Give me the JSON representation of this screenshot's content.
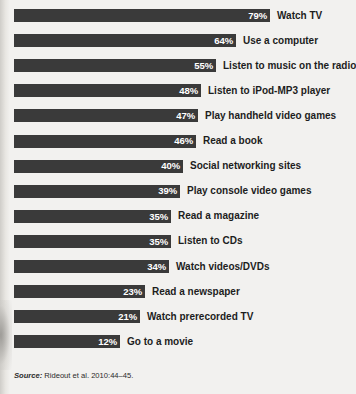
{
  "chart_data": {
    "type": "bar",
    "orientation": "horizontal",
    "title": "",
    "xlabel": "",
    "ylabel": "",
    "grid": false,
    "legend": null,
    "xlim": [
      0,
      100
    ],
    "value_suffix": "%",
    "categories": [
      "Watch TV",
      "Use a computer",
      "Listen to music on the radio",
      "Listen to iPod-MP3 player",
      "Play handheld video games",
      "Read a book",
      "Social networking sites",
      "Play console video games",
      "Read a magazine",
      "Listen to CDs",
      "Watch videos/DVDs",
      "Read a newspaper",
      "Watch prerecorded TV",
      "Go to a movie"
    ],
    "values": [
      79,
      64,
      55,
      48,
      47,
      46,
      40,
      39,
      35,
      35,
      34,
      23,
      21,
      12
    ],
    "value_labels": [
      "79%",
      "64%",
      "55%",
      "48%",
      "47%",
      "46%",
      "40%",
      "39%",
      "35%",
      "35%",
      "34%",
      "23%",
      "21%",
      "12%"
    ],
    "bar_color": "#3a3a3a",
    "value_label_color": "#ffffff",
    "category_label_color": "#1d1d1d",
    "background_color": "#f2f1ef"
  },
  "source": {
    "word": "Source:",
    "text": "Rideout et al. 2010:44–45."
  }
}
